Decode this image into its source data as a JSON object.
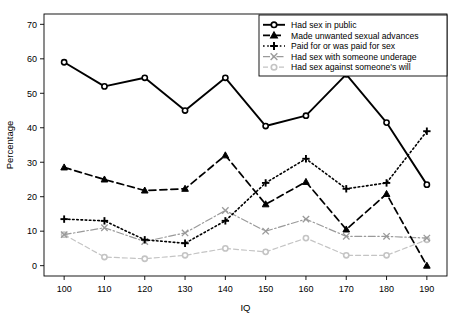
{
  "chart_data": {
    "type": "line",
    "title": "",
    "xlabel": "IQ",
    "ylabel": "Percentage",
    "x": [
      100,
      110,
      120,
      130,
      140,
      150,
      160,
      170,
      180,
      190
    ],
    "xlim": [
      95,
      195
    ],
    "ylim": [
      -3,
      73
    ],
    "xticks": [
      "100",
      "110",
      "120",
      "130",
      "140",
      "150",
      "160",
      "170",
      "180",
      "190"
    ],
    "yticks": [
      "0",
      "10",
      "20",
      "30",
      "40",
      "50",
      "60",
      "70"
    ],
    "grid": false,
    "legend_position": "top-right",
    "series": [
      {
        "name": "Had sex in public",
        "values": [
          59,
          52,
          54.5,
          45,
          54.5,
          40.5,
          43.5,
          55.5,
          41.5,
          23.5
        ],
        "color": "#000000",
        "marker": "circle-open",
        "linestyle": "solid",
        "linewidth": 1.9
      },
      {
        "name": "Made unwanted sexual advances",
        "values": [
          28.5,
          25,
          21.8,
          22.3,
          32,
          17.8,
          24.3,
          10.5,
          20.8,
          0
        ],
        "color": "#000000",
        "marker": "triangle",
        "linestyle": "dashed",
        "linewidth": 1.7
      },
      {
        "name": "Paid for or was paid for sex",
        "values": [
          13.5,
          13,
          7.5,
          6.5,
          13,
          24,
          31,
          22.3,
          24,
          39
        ],
        "color": "#000000",
        "marker": "plus",
        "linestyle": "dotted",
        "linewidth": 1.6
      },
      {
        "name": "Had sex with someone underage",
        "values": [
          9,
          11,
          7,
          9.5,
          16,
          10,
          13.5,
          8.5,
          8.5,
          8
        ],
        "color": "#9a9a9a",
        "marker": "x",
        "linestyle": "dashdot",
        "linewidth": 1.2
      },
      {
        "name": "Had sex against someone's will",
        "values": [
          9,
          2.5,
          2,
          3,
          5,
          4,
          8,
          3,
          3,
          7.5
        ],
        "color": "#c4c4c4",
        "marker": "circle-open",
        "linestyle": "dashed",
        "linewidth": 1.2
      }
    ]
  },
  "legend": {
    "items": [
      "Had sex in public",
      "Made unwanted sexual advances",
      "Paid for or was paid for sex",
      "Had sex with someone underage",
      "Had sex against someone's will"
    ]
  },
  "axes": {
    "x_title": "IQ",
    "y_title": "Percentage"
  }
}
